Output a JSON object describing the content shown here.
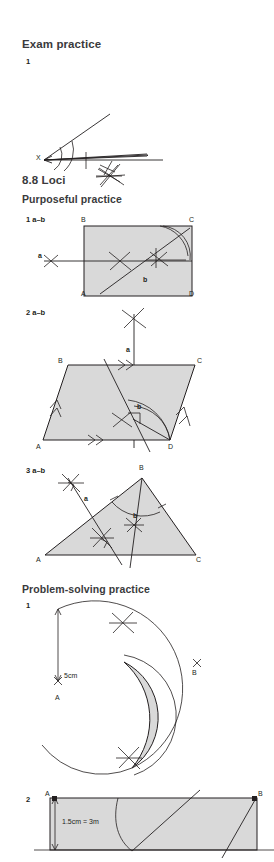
{
  "page": {
    "width": 274,
    "height": 862,
    "background": "#ffffff",
    "ink": "#231f20",
    "shape_fill": "#d9d9d9",
    "heading_color": "#3a3a3c"
  },
  "sections": [
    {
      "id": "exam-practice",
      "title": "Exam practice",
      "questions": [
        {
          "number": "1",
          "type": "angle-bisector-construction",
          "vertex_label": "X",
          "description": "Angle at X with two rays, construction arcs and crossing arcs marking the bisector"
        }
      ]
    },
    {
      "id": "loci",
      "title": "8.8 Loci",
      "subsections": [
        {
          "id": "purposeful-practice",
          "title": "Purposeful practice",
          "questions": [
            {
              "number": "1 a–b",
              "type": "rectangle-loci",
              "vertices": [
                "B",
                "C",
                "A",
                "D"
              ],
              "annotations": [
                "a",
                "b"
              ],
              "note": "Rectangle ABCD with horizontal perpendicular bisector line (a) and diagonal angle bisector (b)"
            },
            {
              "number": "2 a–b",
              "type": "parallelogram-loci",
              "vertices": [
                "B",
                "C",
                "A",
                "D"
              ],
              "annotations": [
                "a",
                "b"
              ],
              "note": "Parallelogram ABCD with double-arrow tick marks on AD and BC, single-arrow ticks on AB and DC"
            },
            {
              "number": "3 a–b",
              "type": "triangle-loci",
              "vertices": [
                "A",
                "B",
                "C"
              ],
              "annotations": [
                "a",
                "b"
              ],
              "note": "Triangle ABC with perpendicular bisector (a) and angle bisector from B (b)"
            }
          ]
        },
        {
          "id": "problem-solving-practice",
          "title": "Problem-solving practice",
          "questions": [
            {
              "number": "1",
              "type": "two-circle-intersection-region",
              "dimension_label": "5cm",
              "point_labels": [
                "A",
                "B"
              ],
              "note": "Arc of radius 5cm about point A and a second arc about B; the overlapping lens region is shaded"
            },
            {
              "number": "2",
              "type": "scale-rectangle-loci",
              "dimension_label": "1.5cm = 3m",
              "point_labels": [
                "A",
                "B"
              ],
              "note": "Shaded rectangle with 1.5cm = 3m vertical dimension arrow, a curve and two slanted lines"
            }
          ]
        }
      ]
    }
  ],
  "labels": {
    "exam_practice": "Exam practice",
    "q1": "1",
    "loci_title": "8.8 Loci",
    "purposeful": "Purposeful practice",
    "q1ab": "1 a–b",
    "q2ab": "2 a–b",
    "q3ab": "3 a–b",
    "problem_solving": "Problem-solving practice",
    "ps_q1": "1",
    "ps_q2": "2",
    "X": "X",
    "A": "A",
    "B": "B",
    "C": "C",
    "D": "D",
    "a": "a",
    "b": "b",
    "five_cm": "5cm",
    "scale": "1.5cm = 3m"
  }
}
